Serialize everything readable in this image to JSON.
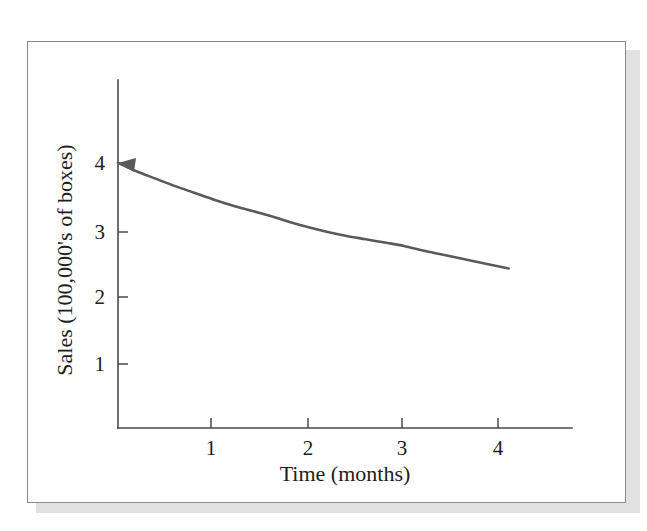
{
  "figure": {
    "background_color": "#ffffff",
    "frame_color": "#8a8a8a",
    "shadow_color": "#c9c9c9",
    "ink_color": "#1d1d1d",
    "curve_color": "#5a5a5a",
    "axis_color": "#4a4a4a"
  },
  "chart_data": {
    "type": "line",
    "title": "",
    "subtitle": "",
    "xlabel": "Time (months)",
    "ylabel": "Sales (100,000's of boxes)",
    "xlim": [
      0,
      4.75
    ],
    "ylim": [
      0,
      5.2
    ],
    "xticks": [
      1,
      2,
      3,
      4
    ],
    "xticklabels": [
      "1",
      "2",
      "3",
      "4"
    ],
    "yticks": [
      1,
      2,
      3,
      4
    ],
    "yticklabels": [
      "1",
      "2",
      "3",
      "4"
    ],
    "grid": false,
    "legend": false,
    "legend_position": "none",
    "annotations": [
      {
        "name": "start-arrowhead",
        "text": "",
        "x": 0,
        "y": 4,
        "note": "arrowhead at curve start pointing left toward y-axis"
      }
    ],
    "series": [
      {
        "name": "Sales decay",
        "style": "solid",
        "color": "#5a5a5a",
        "x": [
          0.0,
          0.2,
          0.4,
          0.6,
          0.8,
          1.0,
          1.2,
          1.4,
          1.6,
          1.8,
          2.0,
          2.2,
          2.4,
          2.6,
          2.8,
          3.0,
          3.2,
          3.4,
          3.6,
          3.8,
          4.0,
          4.1
        ],
        "y": [
          4.0,
          3.87,
          3.76,
          3.65,
          3.55,
          3.45,
          3.36,
          3.28,
          3.2,
          3.11,
          3.03,
          2.96,
          2.9,
          2.85,
          2.8,
          2.75,
          2.68,
          2.62,
          2.56,
          2.5,
          2.44,
          2.41
        ]
      }
    ]
  },
  "axes": {
    "y_tick_1": "1",
    "y_tick_2": "2",
    "y_tick_3": "3",
    "y_tick_4": "4",
    "x_tick_1": "1",
    "x_tick_2": "2",
    "x_tick_3": "3",
    "x_tick_4": "4",
    "x_title": "Time (months)",
    "y_title": "Sales (100,000's of boxes)"
  }
}
